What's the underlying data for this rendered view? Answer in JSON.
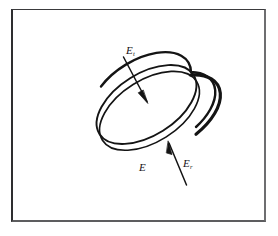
{
  "figure": {
    "name": "tilted-disk-field-diagram",
    "background_color": "#ffffff",
    "ink_color": "#141414",
    "frame": {
      "border_top_color": "#3a3a3c",
      "border_left_color": "#2e2e30",
      "border_right_color": "#6e6e70",
      "border_bottom_color": "#5d5d5f",
      "fill_color": "#ffffff"
    },
    "labels": [
      {
        "id": "label-et",
        "name": "label-E-tangential",
        "base": "E",
        "subscript": "t",
        "position": "upper-left of disk face"
      },
      {
        "id": "label-e",
        "name": "label-E",
        "base": "E",
        "subscript": "",
        "position": "below disk, center"
      },
      {
        "id": "label-er",
        "name": "label-E-radial",
        "base": "E",
        "subscript": "r",
        "position": "lower right of disk"
      }
    ],
    "arrows": [
      {
        "name": "arrow-to-disk-face",
        "from": "upper-left",
        "to": "disk-face-center",
        "description": "leader arrow from E-subscript-t label pointing down-right onto the top face of the disk"
      },
      {
        "name": "arrow-to-disk-rim",
        "from": "lower-right",
        "to": "disk-rim",
        "description": "leader arrow from E-subscript-r label pointing up-left onto the hatched rim of the disk"
      }
    ],
    "disk": {
      "name": "tilted-disk",
      "description": "an ellipse representing a disk seen in perspective, tilted with its long axis running from lower-left to upper-right, drawn with a ribbed (hatched) thickness band along its lower-right rim",
      "rim_hatch_count": 26,
      "rim_style": "ribbed-hatched-band"
    }
  }
}
